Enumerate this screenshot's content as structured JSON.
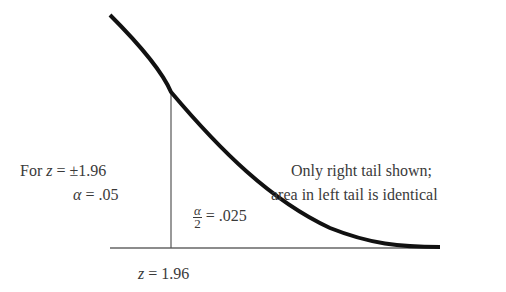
{
  "diagram": {
    "type": "normal-distribution-right-tail",
    "critical_value_label": {
      "var": "z",
      "eq": " = ",
      "value": "1.96"
    },
    "left_annotation": {
      "line1_prefix": "For ",
      "line1_var": "z",
      "line1_rest": " = ±1.96",
      "line2_var": "α",
      "line2_rest": " = .05"
    },
    "tail_area_label": {
      "numerator": "α",
      "denominator": "2",
      "rest": " = .025"
    },
    "note": {
      "line1": "Only right tail shown;",
      "line2": "area in left tail is identical"
    },
    "colors": {
      "curve": "#111111",
      "axis": "#555555",
      "text": "#3a3a3a"
    }
  }
}
